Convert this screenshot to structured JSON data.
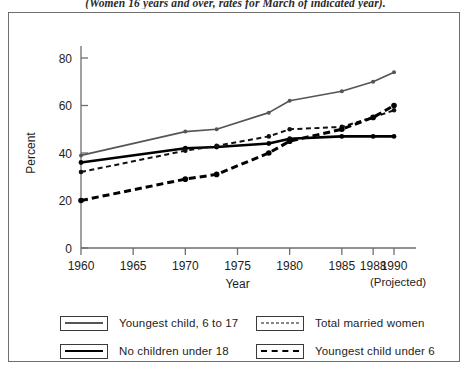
{
  "figure": {
    "caption": "(Women 16 years and over, rates for March of indicated year)."
  },
  "chart_data": {
    "type": "line",
    "title": "",
    "subtitle": "",
    "xlabel": "Year",
    "ylabel": "Percent",
    "xlim": [
      1960,
      1990
    ],
    "ylim": [
      0,
      88
    ],
    "yticks": [
      0,
      20,
      40,
      60,
      80
    ],
    "ytick_labels": [
      "0",
      "20",
      "40",
      "60",
      "80"
    ],
    "xticks": [
      1960,
      1965,
      1970,
      1975,
      1980,
      1985,
      1988,
      1990
    ],
    "xtick_labels": [
      "1960",
      "1965",
      "1970",
      "1975",
      "1980",
      "1985",
      "1988",
      "1990"
    ],
    "xtick_note": "(Projected)",
    "grid": false,
    "legend_position": "below-plot",
    "series": [
      {
        "name": "Youngest child, 6 to 17",
        "style": "solid",
        "color": "#555555",
        "x": [
          1960,
          1970,
          1973,
          1978,
          1980,
          1985,
          1988,
          1990
        ],
        "values": [
          39,
          49,
          50,
          57,
          62,
          66,
          70,
          74
        ]
      },
      {
        "name": "No children under 18",
        "style": "solid-bold",
        "color": "#000000",
        "x": [
          1960,
          1970,
          1973,
          1978,
          1980,
          1985,
          1988,
          1990
        ],
        "values": [
          36,
          42,
          42.5,
          44,
          46,
          47,
          47,
          47
        ]
      },
      {
        "name": "Total married women",
        "style": "dotted",
        "color": "#111111",
        "x": [
          1960,
          1970,
          1973,
          1978,
          1980,
          1985,
          1988,
          1990
        ],
        "values": [
          32,
          41,
          43,
          47,
          50,
          51,
          55,
          58
        ]
      },
      {
        "name": "Youngest child under 6",
        "style": "dashed",
        "color": "#000000",
        "x": [
          1960,
          1970,
          1973,
          1978,
          1980,
          1985,
          1988,
          1990
        ],
        "values": [
          20,
          29,
          31,
          40,
          45,
          50,
          55,
          60
        ]
      }
    ]
  },
  "legend": {
    "entries": [
      {
        "label": "Youngest child, 6 to 17",
        "style": "solid-gray"
      },
      {
        "label": "No children under 18",
        "style": "solid-black"
      },
      {
        "label": "Total married women",
        "style": "dotted"
      },
      {
        "label": "Youngest child under 6",
        "style": "dashed"
      }
    ]
  }
}
